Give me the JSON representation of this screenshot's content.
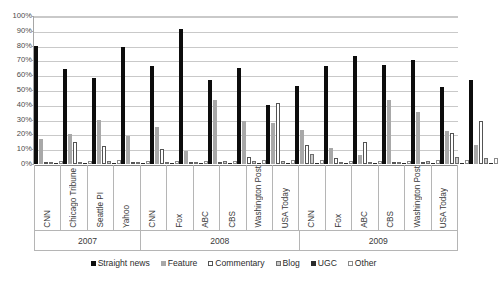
{
  "chart_data": {
    "type": "bar",
    "title": "",
    "xlabel": "",
    "ylabel": "",
    "ylim": [
      0,
      100
    ],
    "ytick_labels": [
      "100%",
      "90%",
      "80%",
      "70%",
      "60%",
      "50%",
      "40%",
      "30%",
      "20%",
      "10%",
      "0%"
    ],
    "ytick_values": [
      100,
      90,
      80,
      70,
      60,
      50,
      40,
      30,
      20,
      10,
      0
    ],
    "grid": true,
    "legend_position": "bottom",
    "categories": [
      "CNN",
      "Chicago Tribune",
      "Seattle PI",
      "Yahoo",
      "CNN",
      "Fox",
      "ABC",
      "CBS",
      "Washington Post",
      "USA Today",
      "CNN",
      "Fox",
      "ABC",
      "CBS",
      "Washington Post",
      "USA Today"
    ],
    "group_labels": [
      "2007",
      "2008",
      "2009"
    ],
    "group_sizes": [
      4,
      6,
      6
    ],
    "series": [
      {
        "name": "Straight news",
        "color": "#0d0d0d",
        "values": [
          80,
          64,
          58,
          79,
          66,
          91,
          57,
          65,
          40,
          53,
          66,
          73,
          67,
          70,
          52,
          57
        ]
      },
      {
        "name": "Feature",
        "color": "#a8a8a8",
        "values": [
          17,
          20,
          30,
          19,
          25,
          9,
          43,
          29,
          28,
          23,
          11,
          6,
          43,
          35,
          22,
          13
        ]
      },
      {
        "name": "Commentary",
        "color": "#ffffff",
        "values": [
          1,
          15,
          12,
          1,
          10,
          1,
          1,
          5,
          41,
          13,
          4,
          15,
          0,
          1,
          21,
          29
        ]
      },
      {
        "name": "Blog",
        "color": "#c9c9c9",
        "values": [
          1,
          1,
          2,
          1,
          1,
          1,
          2,
          2,
          2,
          7,
          1,
          1,
          1,
          2,
          5,
          4
        ]
      },
      {
        "name": "UGC",
        "color": "#2b2b2b",
        "values": [
          1,
          1,
          1,
          1,
          1,
          1,
          1,
          1,
          1,
          1,
          1,
          1,
          1,
          1,
          1,
          1
        ]
      },
      {
        "name": "Other",
        "color": "#ffffff",
        "values": [
          2,
          2,
          3,
          2,
          2,
          2,
          2,
          3,
          3,
          3,
          2,
          2,
          2,
          3,
          3,
          4
        ]
      }
    ]
  }
}
